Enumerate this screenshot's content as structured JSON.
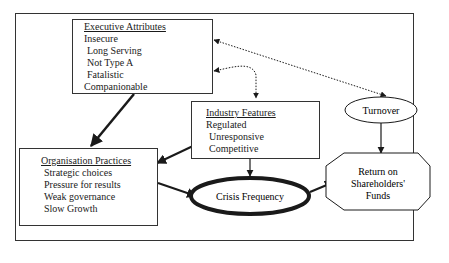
{
  "executive_attributes": {
    "title": "Executive Attributes",
    "items": [
      "Insecure",
      " Long Serving",
      " Not Type A",
      " Fatalistic",
      "Companionable"
    ]
  },
  "industry_features": {
    "title": "Industry Features",
    "items": [
      "Regulated",
      " Unresponsive",
      " Competitive"
    ]
  },
  "organisation_practices": {
    "title": "Organisation Practices",
    "items": [
      "Strategic choices",
      "Pressure for results",
      "Weak governance",
      "Slow Growth"
    ]
  },
  "turnover": {
    "label": "Turnover"
  },
  "crisis_frequency": {
    "label": "Crisis Frequency"
  },
  "return": {
    "line1": "Return on",
    "line2": "Shareholders'",
    "line3": "Funds"
  }
}
